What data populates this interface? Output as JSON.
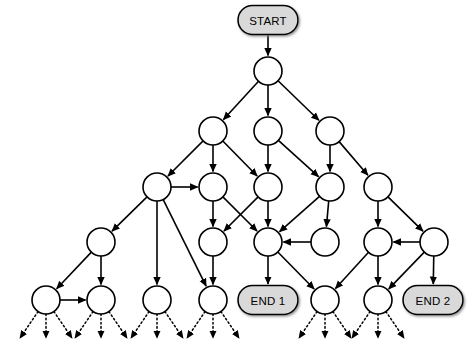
{
  "diagram": {
    "type": "directed-graph",
    "background_color": "#ffffff",
    "edge_color": "#000000",
    "node_fill": "#ffffff",
    "node_stroke": "#000000",
    "terminal_fill": "#d9d9d9",
    "terminal_stroke": "#000000",
    "node_radius": 14,
    "terminal_labels": {
      "start": "START",
      "end_1": "END 1",
      "end_2": "END 2"
    },
    "terminals": [
      {
        "id": "START",
        "label": "START",
        "x": 268,
        "y": 20,
        "w": 60,
        "h": 29,
        "shape": "rounded-rect"
      },
      {
        "id": "END1",
        "label": "END 1",
        "x": 268,
        "y": 300,
        "w": 60,
        "h": 29,
        "shape": "rounded-rect"
      },
      {
        "id": "END2",
        "label": "END 2",
        "x": 433,
        "y": 300,
        "w": 60,
        "h": 29,
        "shape": "rounded-rect"
      }
    ],
    "nodes": [
      {
        "id": "n0",
        "row": 1,
        "x": 268,
        "y": 71,
        "label": ""
      },
      {
        "id": "n10",
        "row": 2,
        "x": 213,
        "y": 131,
        "label": ""
      },
      {
        "id": "n11",
        "row": 2,
        "x": 268,
        "y": 131,
        "label": ""
      },
      {
        "id": "n12",
        "row": 2,
        "x": 330,
        "y": 131,
        "label": ""
      },
      {
        "id": "n20",
        "row": 3,
        "x": 157,
        "y": 187,
        "label": ""
      },
      {
        "id": "n21",
        "row": 3,
        "x": 213,
        "y": 187,
        "label": ""
      },
      {
        "id": "n22",
        "row": 3,
        "x": 268,
        "y": 187,
        "label": ""
      },
      {
        "id": "n23",
        "row": 3,
        "x": 330,
        "y": 187,
        "label": ""
      },
      {
        "id": "n24",
        "row": 3,
        "x": 378,
        "y": 187,
        "label": ""
      },
      {
        "id": "n30",
        "row": 4,
        "x": 101,
        "y": 242,
        "label": ""
      },
      {
        "id": "n31",
        "row": 4,
        "x": 213,
        "y": 242,
        "label": ""
      },
      {
        "id": "n32",
        "row": 4,
        "x": 268,
        "y": 242,
        "label": ""
      },
      {
        "id": "n33",
        "row": 4,
        "x": 325,
        "y": 242,
        "label": ""
      },
      {
        "id": "n34",
        "row": 4,
        "x": 378,
        "y": 242,
        "label": ""
      },
      {
        "id": "n35",
        "row": 4,
        "x": 434,
        "y": 242,
        "label": ""
      },
      {
        "id": "n40",
        "row": 5,
        "x": 46,
        "y": 300,
        "label": ""
      },
      {
        "id": "n41",
        "row": 5,
        "x": 101,
        "y": 300,
        "label": ""
      },
      {
        "id": "n42",
        "row": 5,
        "x": 157,
        "y": 300,
        "label": ""
      },
      {
        "id": "n43",
        "row": 5,
        "x": 213,
        "y": 300,
        "label": ""
      },
      {
        "id": "n44",
        "row": 5,
        "x": 325,
        "y": 300,
        "label": ""
      },
      {
        "id": "n45",
        "row": 5,
        "x": 378,
        "y": 300,
        "label": ""
      }
    ],
    "edges": [
      {
        "from": "START",
        "to": "n0",
        "style": "solid"
      },
      {
        "from": "n0",
        "to": "n10",
        "style": "solid"
      },
      {
        "from": "n0",
        "to": "n11",
        "style": "solid"
      },
      {
        "from": "n0",
        "to": "n12",
        "style": "solid"
      },
      {
        "from": "n10",
        "to": "n20",
        "style": "solid"
      },
      {
        "from": "n10",
        "to": "n21",
        "style": "solid"
      },
      {
        "from": "n10",
        "to": "n22",
        "style": "solid"
      },
      {
        "from": "n11",
        "to": "n22",
        "style": "solid"
      },
      {
        "from": "n11",
        "to": "n23",
        "style": "solid"
      },
      {
        "from": "n12",
        "to": "n23",
        "style": "solid"
      },
      {
        "from": "n12",
        "to": "n24",
        "style": "solid"
      },
      {
        "from": "n20",
        "to": "n21",
        "style": "solid"
      },
      {
        "from": "n20",
        "to": "n30",
        "style": "solid"
      },
      {
        "from": "n20",
        "to": "n42",
        "style": "solid"
      },
      {
        "from": "n20",
        "to": "n43",
        "style": "solid"
      },
      {
        "from": "n21",
        "to": "n31",
        "style": "solid"
      },
      {
        "from": "n21",
        "to": "n32",
        "style": "solid"
      },
      {
        "from": "n22",
        "to": "n31",
        "style": "solid"
      },
      {
        "from": "n22",
        "to": "n32",
        "style": "solid"
      },
      {
        "from": "n23",
        "to": "n32",
        "style": "solid"
      },
      {
        "from": "n23",
        "to": "n33",
        "style": "solid"
      },
      {
        "from": "n24",
        "to": "n34",
        "style": "solid"
      },
      {
        "from": "n24",
        "to": "n35",
        "style": "solid"
      },
      {
        "from": "n33",
        "to": "n32",
        "style": "solid"
      },
      {
        "from": "n35",
        "to": "n34",
        "style": "solid"
      },
      {
        "from": "n30",
        "to": "n40",
        "style": "solid"
      },
      {
        "from": "n30",
        "to": "n41",
        "style": "solid"
      },
      {
        "from": "n40",
        "to": "n41",
        "style": "solid"
      },
      {
        "from": "n31",
        "to": "n43",
        "style": "solid"
      },
      {
        "from": "n32",
        "to": "END1",
        "style": "solid"
      },
      {
        "from": "n32",
        "to": "n44",
        "style": "solid"
      },
      {
        "from": "n34",
        "to": "n44",
        "style": "solid"
      },
      {
        "from": "n34",
        "to": "n45",
        "style": "solid"
      },
      {
        "from": "n35",
        "to": "n45",
        "style": "solid"
      },
      {
        "from": "n35",
        "to": "END2",
        "style": "solid"
      }
    ],
    "frontier_edges": {
      "style": "dotted",
      "description": "unexpanded frontier arrows leaving each bottom-row node",
      "sources": [
        "n40",
        "n41",
        "n42",
        "n43",
        "n44",
        "n45"
      ],
      "fan_offsets": [
        -26,
        0,
        26
      ],
      "length": 38
    }
  }
}
